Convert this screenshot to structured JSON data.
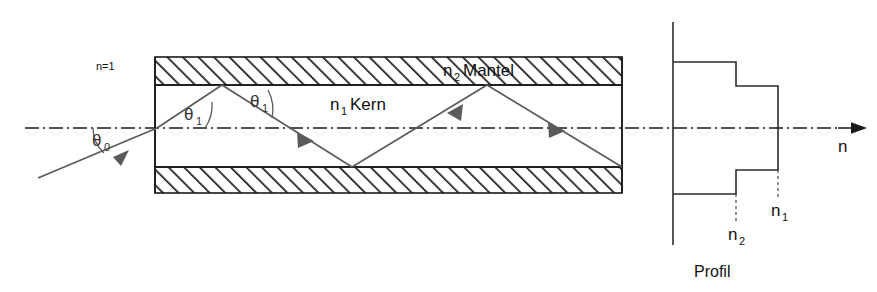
{
  "figure": {
    "labels": {
      "outside_medium": "n=1",
      "core_symbol": "n",
      "core_subscript": "1",
      "core_name": "Kern",
      "cladding_symbol": "n",
      "cladding_subscript": "2",
      "cladding_name": "Mantel",
      "angle_entry_symbol": "θ",
      "angle_entry_subscript": "0",
      "angle_internal_symbol": "θ",
      "angle_internal_subscript": "1",
      "axis_label": "n",
      "profile_caption": "Profil",
      "profile_tick_core_symbol": "n",
      "profile_tick_core_subscript": "1",
      "profile_tick_clad_symbol": "n",
      "profile_tick_clad_subscript": "2"
    },
    "colors": {
      "structure": "#1a1a1a",
      "ray": "#5a5a5a",
      "profile": "#2b2b2b",
      "background": "#ffffff",
      "text": "#111111"
    },
    "geometry": {
      "fiber_left": 155,
      "fiber_right": 622,
      "clad_top_outer": 57,
      "clad_top_inner": 85,
      "clad_bottom_inner": 167,
      "clad_bottom_outer": 193,
      "axis_y": 128,
      "axis_start_x": 25,
      "axis_end_x": 855
    },
    "ray_path": [
      {
        "x": 38,
        "y": 178
      },
      {
        "x": 157,
        "y": 128
      },
      {
        "x": 222,
        "y": 85
      },
      {
        "x": 352,
        "y": 167
      },
      {
        "x": 487,
        "y": 85
      },
      {
        "x": 622,
        "y": 167
      }
    ],
    "angle_arcs": [
      {
        "name": "theta-0",
        "label_x": 97,
        "label_y": 140
      },
      {
        "name": "theta-1-first",
        "label_x": 192,
        "label_y": 117
      },
      {
        "name": "theta-1-second",
        "label_x": 258,
        "label_y": 104
      }
    ]
  },
  "profile_chart": {
    "type": "step",
    "description": "Step-index refractive index profile: core index n1 higher than cladding index n2",
    "axis_x": 673,
    "levels": {
      "n1_edge_x": 778,
      "n2_edge_x": 736,
      "top_outer_y": 62,
      "top_step_y": 86,
      "bottom_step_y": 170,
      "bottom_outer_y": 194,
      "vertical_axis_top": 22,
      "vertical_axis_bottom": 245
    },
    "values": [
      {
        "region": "cladding-upper",
        "symbol": "n2",
        "radial_extent": "outer"
      },
      {
        "region": "core",
        "symbol": "n1",
        "radial_extent": "center"
      },
      {
        "region": "cladding-lower",
        "symbol": "n2",
        "radial_extent": "outer"
      }
    ]
  }
}
